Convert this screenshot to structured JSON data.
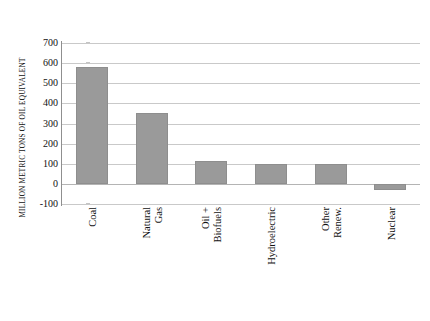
{
  "chart_data": {
    "type": "bar",
    "title": "",
    "xlabel": "",
    "ylabel": "MILLION METRIC TONS OF OIL EQUIVALENT",
    "categories": [
      "Coal",
      "Natural Gas",
      "Oil + Biofuels",
      "Hydroelectric",
      "Other Renew.",
      "Nuclear"
    ],
    "category_lines": [
      [
        "Coal"
      ],
      [
        "Natural",
        "Gas"
      ],
      [
        "Oil +",
        "Biofuels"
      ],
      [
        "Hydroelectric"
      ],
      [
        "Other",
        "Renew."
      ],
      [
        "Nuclear"
      ]
    ],
    "values": [
      580,
      350,
      115,
      100,
      100,
      -30
    ],
    "ylim": [
      -100,
      700
    ],
    "ytick_step": 100,
    "yticks": [
      700,
      600,
      500,
      400,
      300,
      200,
      100,
      0,
      -100
    ],
    "ytick_labels": [
      "700",
      "600",
      "500",
      "400",
      "300",
      "200",
      "100",
      "0",
      "-100"
    ],
    "grid": true,
    "legend": false,
    "bar_color": "#9a9a9a",
    "gridline_color": "#c9c9c9",
    "axis_color": "#8f8f8f",
    "background": "#ffffff"
  }
}
